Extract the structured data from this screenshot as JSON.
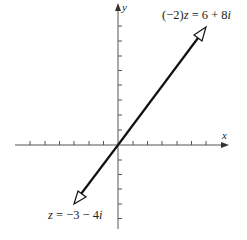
{
  "figure": {
    "type": "complex-plane-diagram",
    "axes": {
      "x_label": "x",
      "y_label": "y",
      "x_ticks_left": 6,
      "x_ticks_right": 6,
      "y_ticks_up": 8,
      "y_ticks_down": 5
    },
    "vectors": [
      {
        "name": "z",
        "re": -3,
        "im": -4,
        "label": "z = −3 − 4i"
      },
      {
        "name": "(-2)z",
        "re": 6,
        "im": 8,
        "label": "(−2)z = 6 + 8i"
      }
    ],
    "labels": {
      "upper_prefix": "(−2)",
      "upper_z": "z",
      "upper_eq": " = 6 + 8",
      "upper_i": "i",
      "lower_z": "z",
      "lower_eq": " = −3 − 4",
      "lower_i": "i"
    },
    "colors": {
      "axis": "#555555",
      "vector": "#111111",
      "text": "#222222",
      "background": "#ffffff"
    }
  }
}
